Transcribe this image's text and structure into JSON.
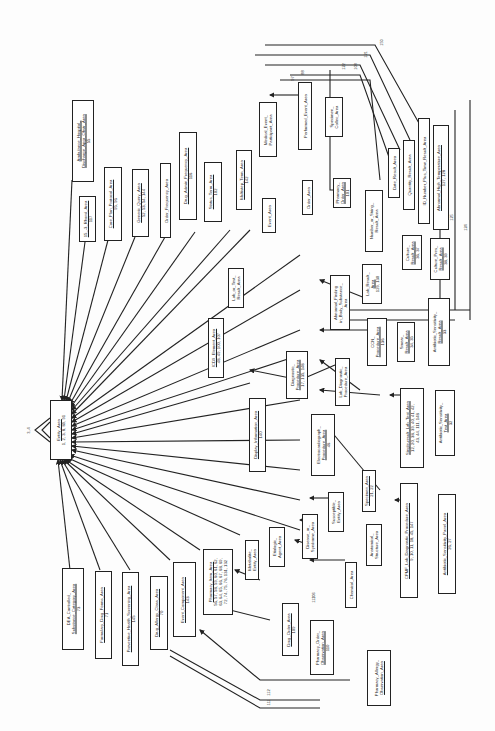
{
  "diagram": {
    "orientation": "rotated-90-ccw",
    "hub": {
      "title": "Entity_Area",
      "numbers": "1, 2, 3, 8, 89, 91",
      "self_loop_labels": [
        "3, 4",
        "6, 7"
      ]
    },
    "boxes": [
      {
        "id": "amb-hosp",
        "title": "Ambulance_Hospital_Discharge_Apgr_Obstr_Area",
        "lines": [
          "Ambulance_Hospital_",
          "Discharge_Apgr_Obstr_Area"
        ],
        "numbers": "55"
      },
      {
        "id": "ekg",
        "title": "12-Lead_EKG_Area",
        "lines": [
          "15_-3_Rhond_Area"
        ],
        "numbers": "117"
      },
      {
        "id": "care-plan",
        "title": "Care_Plan_Protocol_Area",
        "lines": [
          "Care_Plan_Protocol_Area"
        ],
        "numbers": "95, 96"
      },
      {
        "id": "generic-query",
        "title": "Generic_Query_Area",
        "lines": [
          "Generic_Query_Area"
        ],
        "numbers": "52, 53, 54, 144"
      },
      {
        "id": "order-freq",
        "title": "Order_Frequency_Area",
        "lines": [
          "Order_Frequency_Area"
        ],
        "numbers": ""
      },
      {
        "id": "drug-admin-freq",
        "title": "Drug_Admin_Frequency_Area",
        "lines": [
          "Drug_Admin_Frequency_Area"
        ],
        "numbers": "116"
      },
      {
        "id": "status-term",
        "title": "Status_Term_Area",
        "lines": [
          "Status_Term_Area"
        ],
        "numbers": "102"
      },
      {
        "id": "multistep-term",
        "title": "Multistep_Term_Area",
        "lines": [
          "Multistep_Term_Area"
        ],
        "numbers": "142"
      },
      {
        "id": "medical-event",
        "title": "Medical_Event_Participant_Area",
        "lines": [
          "Medical_Event_",
          "Participant_Area"
        ],
        "numbers": ""
      },
      {
        "id": "event",
        "title": "Event_Area",
        "lines": [
          "Event_Area"
        ],
        "numbers": ""
      },
      {
        "id": "performed-event",
        "title": "Performed_Event_Area",
        "lines": [
          "Performed_Event_Area"
        ],
        "numbers": ""
      },
      {
        "id": "specimen-collec",
        "title": "Specimen_Collec_Area",
        "lines": [
          "Specimen_",
          "Collec_Area"
        ],
        "numbers": ""
      },
      {
        "id": "order",
        "title": "Order_Area",
        "lines": [
          "Order_Area"
        ],
        "numbers": ""
      },
      {
        "id": "pharmacy-order",
        "title": "Pharmacy_Order_Area",
        "lines": [
          "Pharmacy_",
          "Order_Area"
        ],
        "numbers": "101"
      },
      {
        "id": "date-result",
        "title": "Date_Result_Area",
        "lines": [
          "Date_Result_Area"
        ],
        "numbers": ""
      },
      {
        "id": "quantity-result",
        "title": "Quantity_Result_Area",
        "lines": [
          "Quantity_Result_Area"
        ],
        "numbers": ""
      },
      {
        "id": "id-number",
        "title": "ID_Number_Plus_Time_Result_Area",
        "lines": [
          "ID_Number_Plus_Time_Result_Area"
        ],
        "numbers": ""
      },
      {
        "id": "abnormal-high",
        "title": "Abnormal_High_Temperature_Area",
        "lines": [
          "Abnormal_High_Temperature_Area"
        ],
        "numbers": "127, 128"
      },
      {
        "id": "number-string",
        "title": "Number_or_String_Result_Area",
        "lines": [
          "Number_or_String_",
          "Result_Area"
        ],
        "numbers": ""
      },
      {
        "id": "lab-test-result",
        "title": "Lab_or_Test_Result_Area",
        "lines": [
          "Lab_or_Test_",
          "Result_Area"
        ],
        "numbers": ""
      },
      {
        "id": "icd9",
        "title": "ICD9_Element_Area",
        "lines": [
          "ICD9_Element_Area"
        ],
        "numbers": "48, 49, 100, 107"
      },
      {
        "id": "abnormal-finding",
        "title": "Abnormal_Finding_in_Body_Substance_Area",
        "lines": [
          "Abnormal_Finding",
          "in_Body_Substance_",
          "Area"
        ],
        "numbers": ""
      },
      {
        "id": "lab-result",
        "title": "Lab_Result_Area",
        "lines": [
          "Lab_Result_",
          "Area"
        ],
        "numbers": "129, 130"
      },
      {
        "id": "culture-result",
        "title": "Culture_Result_Area",
        "lines": [
          "Culture_",
          "Result_Area"
        ],
        "numbers": "36, 37"
      },
      {
        "id": "culture-pres",
        "title": "Culture_Pres_Result_Area",
        "lines": [
          "Culture_Pres_",
          "Result_Area"
        ],
        "numbers": "38, 39"
      },
      {
        "id": "antibiotic-sens-result",
        "title": "Antibiotic_Sensitivity_Result_Area",
        "lines": [
          "Antibiotic_Sensitivity_",
          "Result_Area"
        ],
        "numbers": "33"
      },
      {
        "id": "smear-result",
        "title": "Smear_Result_Area",
        "lines": [
          "Smear_",
          "Result_Area"
        ],
        "numbers": "34, 35"
      },
      {
        "id": "ccn-proc",
        "title": "CCN_Procedure_Area",
        "lines": [
          "CCN_",
          "Procedure_Area"
        ],
        "numbers": "136"
      },
      {
        "id": "diagnostic-proc",
        "title": "Diagnostic_Procedure_Area",
        "lines": [
          "Diagnostic_",
          "Procedure_Area"
        ],
        "numbers": "17, 135, 148"
      },
      {
        "id": "lab-diag-proc",
        "title": "Lab_Diagnostic_Procedure_Area",
        "lines": [
          "Lab_Diagnostic_",
          "Procedure_Area"
        ],
        "numbers": ""
      },
      {
        "id": "display-info",
        "title": "Display_Information_Area",
        "lines": [
          "Display_Information_Area"
        ],
        "numbers": "140"
      },
      {
        "id": "electrocardiograph",
        "title": "Electrocardiograph_Procedure_Area",
        "lines": [
          "Electrocardiograph_",
          "Procedure_Area"
        ],
        "numbers": "46"
      },
      {
        "id": "single-result-lab",
        "title": "Single-result_Lab_Test_Area",
        "lines": [
          "Single-result_Lab_Test_Area",
          "12, 20, 38, 39, 40, 41, 42,",
          "43, 44, 111, 148"
        ],
        "numbers": ""
      },
      {
        "id": "antibiotic-sens-test",
        "title": "Antibiotic_Sensitivity_Test_Area",
        "lines": [
          "Antibiotic_Sensitivity_",
          "Test_Area"
        ],
        "numbers": "32"
      },
      {
        "id": "specimen",
        "title": "Specimen_Area",
        "lines": [
          "Specimen_Area"
        ],
        "numbers": "21, 22"
      },
      {
        "id": "susceptible-entity",
        "title": "Susceptible_Entity_Area",
        "lines": [
          "Susceptible_",
          "Entity_Area"
        ],
        "numbers": ""
      },
      {
        "id": "disease-syndrome",
        "title": "Disease_or_Syndrome_Area",
        "lines": [
          "Disease_or_",
          "Syndrome_Area"
        ],
        "numbers": ""
      },
      {
        "id": "anatomical-struct",
        "title": "Anatomical_Structure_Area",
        "lines": [
          "Anatomical_",
          "Structure_Area"
        ],
        "numbers": ""
      },
      {
        "id": "etiologic-agent",
        "title": "Etiologic_Agent_Area",
        "lines": [
          "Etiologic_",
          "Agent_Area"
        ],
        "numbers": ""
      },
      {
        "id": "metabolite-entity",
        "title": "Metabolite_Entity_Area",
        "lines": [
          "Metabolite_",
          "Entity_Area"
        ],
        "numbers": ""
      },
      {
        "id": "chemical",
        "title": "Chemical_Area",
        "lines": [
          "Chemical_Area"
        ],
        "numbers": ""
      },
      {
        "id": "cpmf-lab-diag",
        "title": "CPMF_Lab_Diagnostic_Procedure_Area",
        "lines": [
          "CPMF_Lab_Diagnostic_Procedure_Area"
        ],
        "numbers": "9, 10, 11, 18, 45, 147"
      },
      {
        "id": "antibiotic-sens-panel",
        "title": "Antibiotic_Sensitivity_Panel_Area",
        "lines": [
          "Antibiotic_Sensitivity_Panel_Area"
        ],
        "numbers": "26, 27"
      },
      {
        "id": "pharmacy-item",
        "title": "Pharmacy_Item_Area",
        "lines": [
          "Pharmacy_Item_Area",
          "56, 57, 58, 59, 60, 61, 62,",
          "63, 64, 65, 66, 67, 68, 69,",
          "72, 74, 75, 76, 131, 132"
        ],
        "numbers": ""
      },
      {
        "id": "event-component",
        "title": "Event_Component_Area",
        "lines": [
          "Event_Component_Area"
        ],
        "numbers": "143"
      },
      {
        "id": "drug-order",
        "title": "Drug_Order_Area",
        "lines": [
          "Drug_Order_Area"
        ],
        "numbers": "109"
      },
      {
        "id": "pharmacy-order-obs",
        "title": "Pharmacy_Order_Observation_Area",
        "lines": [
          "Pharmacy_Order_",
          "Observation_Area"
        ],
        "numbers": "110"
      },
      {
        "id": "pharmacy-allergy-obs",
        "title": "Pharmacy_Allergy_Observation_Area",
        "lines": [
          "Pharmacy_Allergy_",
          "Observation_Area"
        ],
        "numbers": ""
      },
      {
        "id": "drug-allergy-class",
        "title": "Drug_Allergy_Class_Area",
        "lines": [
          "Drug_Allergy_Class_Area"
        ],
        "numbers": "70"
      },
      {
        "id": "preventive-health",
        "title": "Preventive_Health_Screening_Area",
        "lines": [
          "Preventive_Health_Screening_Area"
        ],
        "numbers": "145"
      },
      {
        "id": "formulary-drug",
        "title": "Formulary_Drug_Forms_Area",
        "lines": [
          "Formulary_Drug_Forms_Area"
        ],
        "numbers": "71"
      },
      {
        "id": "dea-controlled",
        "title": "DEA_Controlled_Substance_Category_Area",
        "lines": [
          "DEA_Controlled_",
          "Substance_Category_Area"
        ],
        "numbers": "73"
      }
    ],
    "edge_labels": [
      "150",
      "121",
      "122",
      "108",
      "88",
      "97",
      "87",
      "86",
      "80",
      "81",
      "77",
      "82",
      "76",
      "85",
      "84",
      "83",
      "118",
      "119",
      "125",
      "126",
      "124",
      "94",
      "93",
      "73",
      "72",
      "105",
      "104",
      "139",
      "138",
      "137",
      "134",
      "133",
      "16",
      "15",
      "14",
      "13",
      "29",
      "30",
      "31",
      "25",
      "24",
      "47",
      "116",
      "114",
      "113",
      "106",
      "107",
      "112",
      "111",
      "5"
    ]
  }
}
